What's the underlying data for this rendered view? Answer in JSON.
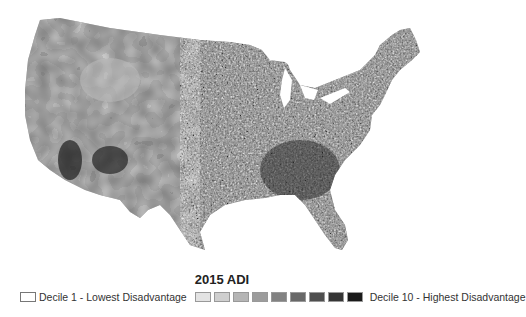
{
  "map": {
    "title": "2015 ADI",
    "region": "Contiguous United States",
    "description": "Census block group choropleth of Area Deprivation Index deciles, grayscale"
  },
  "legend": {
    "low_label": "Decile 1 - Lowest Disadvantage",
    "high_label": "Decile 10 - Highest Disadvantage",
    "deciles": [
      {
        "decile": 1,
        "color": "#ffffff"
      },
      {
        "decile": 2,
        "color": "#e3e3e3"
      },
      {
        "decile": 3,
        "color": "#cfcfcf"
      },
      {
        "decile": 4,
        "color": "#b5b5b5"
      },
      {
        "decile": 5,
        "color": "#9c9c9c"
      },
      {
        "decile": 6,
        "color": "#828282"
      },
      {
        "decile": 7,
        "color": "#686868"
      },
      {
        "decile": 8,
        "color": "#4f4f4f"
      },
      {
        "decile": 9,
        "color": "#353535"
      },
      {
        "decile": 10,
        "color": "#1a1a1a"
      }
    ]
  }
}
